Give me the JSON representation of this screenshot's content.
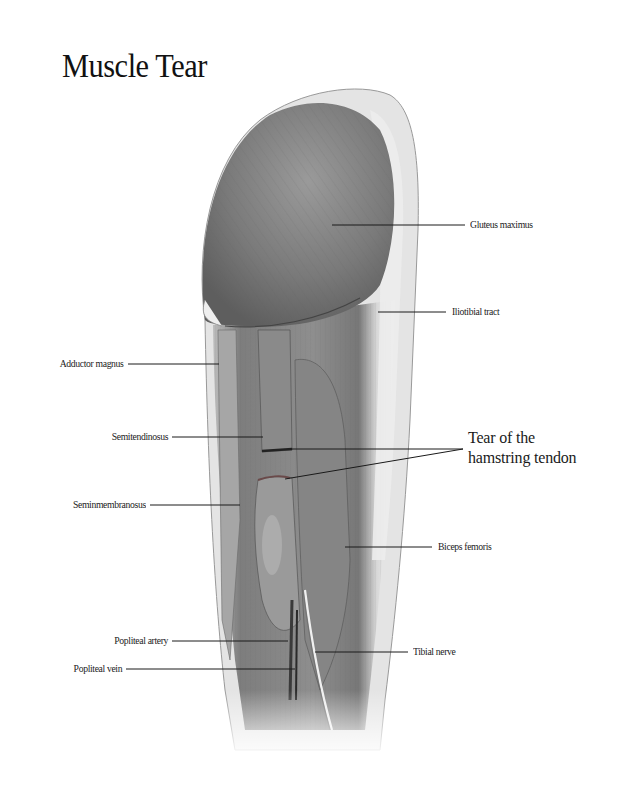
{
  "title": "Muscle Tear",
  "callout": {
    "line1": "Tear of the",
    "line2": "hamstring tendon"
  },
  "labels": {
    "gluteus_maximus": "Gluteus maximus",
    "iliotibial_tract": "Iliotibial tract",
    "adductor_magnus": "Adductor magnus",
    "semitendinosus": "Semitendinosus",
    "semimembranosus": "Seminmembranosus",
    "biceps_femoris": "Biceps femoris",
    "popliteal_artery": "Popliteal artery",
    "popliteal_vein": "Popliteal vein",
    "tibial_nerve": "Tibial nerve"
  },
  "colors": {
    "background": "#ffffff",
    "muscle_dark": "#6b6b6b",
    "muscle_mid": "#8c8c8c",
    "skin_light": "#d6d6d6",
    "leader_line": "#1a1a1a"
  }
}
